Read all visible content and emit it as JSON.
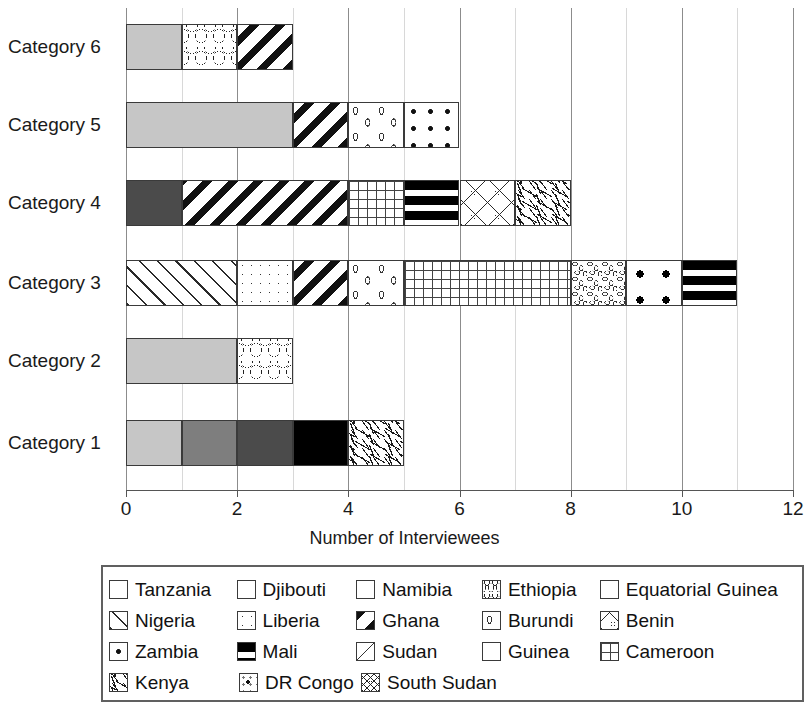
{
  "chart_data": {
    "type": "bar",
    "orientation": "horizontal",
    "stacked": true,
    "title": "",
    "xlabel": "Number of Interviewees",
    "ylabel": "",
    "xlim": [
      0,
      12
    ],
    "xticks": [
      0,
      2,
      4,
      6,
      8,
      10,
      12
    ],
    "xtick_labels": [
      "0",
      "2",
      "4",
      "6",
      "8",
      "10",
      "12"
    ],
    "minor_tick_step": 1,
    "grid": "vertical",
    "legend_position": "bottom",
    "categories": [
      "Category 1",
      "Category 2",
      "Category 3",
      "Category 4",
      "Category 5",
      "Category 6"
    ],
    "series": [
      {
        "name": "Tanzania",
        "values": [
          1,
          2,
          0,
          0,
          3,
          1
        ]
      },
      {
        "name": "Djibouti",
        "values": [
          1,
          0,
          0,
          0,
          0,
          0
        ]
      },
      {
        "name": "Namibia",
        "values": [
          1,
          0,
          0,
          1,
          0,
          0
        ]
      },
      {
        "name": "Ethiopia",
        "values": [
          0,
          1,
          0,
          0,
          0,
          1
        ]
      },
      {
        "name": "Equatorial Guinea",
        "values": [
          1,
          0,
          0,
          0,
          0,
          0
        ]
      },
      {
        "name": "Nigeria",
        "values": [
          0,
          0,
          2,
          0,
          0,
          0
        ]
      },
      {
        "name": "Liberia",
        "values": [
          0,
          0,
          1,
          0,
          0,
          0
        ]
      },
      {
        "name": "Ghana",
        "values": [
          0,
          0,
          1,
          3,
          1,
          1
        ]
      },
      {
        "name": "Burundi",
        "values": [
          0,
          0,
          1,
          0,
          1,
          0
        ]
      },
      {
        "name": "Benin",
        "values": [
          0,
          0,
          0,
          1,
          0,
          0
        ]
      },
      {
        "name": "Zambia",
        "values": [
          0,
          0,
          0,
          0,
          1,
          0
        ]
      },
      {
        "name": "Mali",
        "values": [
          0,
          0,
          1,
          1,
          0,
          0
        ]
      },
      {
        "name": "Sudan",
        "values": [
          0,
          0,
          0,
          0,
          0,
          0
        ]
      },
      {
        "name": "Guinea",
        "values": [
          0,
          0,
          1,
          0,
          0,
          0
        ]
      },
      {
        "name": "Cameroon",
        "values": [
          0,
          0,
          3,
          1,
          0,
          0
        ]
      },
      {
        "name": "Kenya",
        "values": [
          1,
          0,
          0,
          1,
          0,
          0
        ]
      },
      {
        "name": "DR Congo",
        "values": [
          0,
          0,
          0,
          0,
          0,
          0
        ]
      },
      {
        "name": "South Sudan",
        "values": [
          0,
          0,
          1,
          0,
          0,
          0
        ]
      }
    ],
    "totals": [
      5,
      3,
      11,
      8,
      6,
      3
    ],
    "bars": [
      {
        "category": "Category 6",
        "total": 3,
        "segments": [
          {
            "label": "Tanzania",
            "start": 0,
            "value": 1,
            "pattern": "p-tanzania"
          },
          {
            "label": "Ethiopia",
            "start": 1,
            "value": 1,
            "pattern": "p-ethiopia"
          },
          {
            "label": "Ghana",
            "start": 2,
            "value": 1,
            "pattern": "p-ghana"
          }
        ]
      },
      {
        "category": "Category 5",
        "total": 6,
        "segments": [
          {
            "label": "Tanzania",
            "start": 0,
            "value": 3,
            "pattern": "p-tanzania"
          },
          {
            "label": "Ghana",
            "start": 3,
            "value": 1,
            "pattern": "p-ghana"
          },
          {
            "label": "Burundi",
            "start": 4,
            "value": 1,
            "pattern": "p-burundi"
          },
          {
            "label": "Zambia",
            "start": 5,
            "value": 1,
            "pattern": "p-zambia"
          }
        ]
      },
      {
        "category": "Category 4",
        "total": 8,
        "segments": [
          {
            "label": "Namibia",
            "start": 0,
            "value": 1,
            "pattern": "p-namibia"
          },
          {
            "label": "Ghana",
            "start": 1,
            "value": 3,
            "pattern": "p-ghana"
          },
          {
            "label": "Cameroon",
            "start": 4,
            "value": 1,
            "pattern": "p-cameroon"
          },
          {
            "label": "Mali",
            "start": 5,
            "value": 1,
            "pattern": "p-mali"
          },
          {
            "label": "Benin",
            "start": 6,
            "value": 1,
            "pattern": "p-benin"
          },
          {
            "label": "Kenya",
            "start": 7,
            "value": 1,
            "pattern": "p-kenya"
          }
        ]
      },
      {
        "category": "Category 3",
        "total": 11,
        "segments": [
          {
            "label": "Nigeria",
            "start": 0,
            "value": 2,
            "pattern": "p-nigeria"
          },
          {
            "label": "Liberia",
            "start": 2,
            "value": 1,
            "pattern": "p-liberia"
          },
          {
            "label": "Ghana",
            "start": 3,
            "value": 1,
            "pattern": "p-ghana"
          },
          {
            "label": "Burundi",
            "start": 4,
            "value": 1,
            "pattern": "p-burundi"
          },
          {
            "label": "Cameroon",
            "start": 5,
            "value": 3,
            "pattern": "p-cameroon"
          },
          {
            "label": "South Sudan",
            "start": 8,
            "value": 1,
            "pattern": "p-southsudan"
          },
          {
            "label": "Guinea",
            "start": 9,
            "value": 1,
            "pattern": "p-guinea"
          },
          {
            "label": "Mali",
            "start": 10,
            "value": 1,
            "pattern": "p-mali"
          }
        ]
      },
      {
        "category": "Category 2",
        "total": 3,
        "segments": [
          {
            "label": "Tanzania",
            "start": 0,
            "value": 2,
            "pattern": "p-tanzania"
          },
          {
            "label": "Ethiopia",
            "start": 2,
            "value": 1,
            "pattern": "p-ethiopia"
          }
        ]
      },
      {
        "category": "Category 1",
        "total": 5,
        "segments": [
          {
            "label": "Tanzania",
            "start": 0,
            "value": 1,
            "pattern": "p-tanzania"
          },
          {
            "label": "Djibouti",
            "start": 1,
            "value": 1,
            "pattern": "p-djibouti"
          },
          {
            "label": "Namibia",
            "start": 2,
            "value": 1,
            "pattern": "p-namibia"
          },
          {
            "label": "Equatorial Guinea",
            "start": 3,
            "value": 1,
            "pattern": "p-eqguinea"
          },
          {
            "label": "Kenya",
            "start": 4,
            "value": 1,
            "pattern": "p-kenya"
          }
        ]
      }
    ],
    "legend": [
      [
        {
          "label": "Tanzania",
          "pattern": "p-tanzania",
          "width": 130
        },
        {
          "label": "Djibouti",
          "pattern": "p-djibouti",
          "width": 122
        },
        {
          "label": "Namibia",
          "pattern": "p-namibia",
          "width": 128
        },
        {
          "label": "Ethiopia",
          "pattern": "p-ethiopia-legend",
          "width": 120
        },
        {
          "label": "Equatorial Guinea",
          "pattern": "p-eqguinea",
          "width": 200
        }
      ],
      [
        {
          "label": "Nigeria",
          "pattern": "p-nigeria",
          "width": 130
        },
        {
          "label": "Liberia",
          "pattern": "p-liberia",
          "width": 122
        },
        {
          "label": "Ghana",
          "pattern": "p-ghana",
          "width": 128
        },
        {
          "label": "Burundi",
          "pattern": "p-burundi",
          "width": 120
        },
        {
          "label": "Benin",
          "pattern": "p-benin",
          "width": 200
        }
      ],
      [
        {
          "label": "Zambia",
          "pattern": "p-zambia",
          "width": 130
        },
        {
          "label": "Mali",
          "pattern": "p-mali",
          "width": 122
        },
        {
          "label": "Sudan",
          "pattern": "p-sudan",
          "width": 128
        },
        {
          "label": "Guinea",
          "pattern": "p-guinea-legend",
          "width": 120
        },
        {
          "label": "Cameroon",
          "pattern": "p-cameroon",
          "width": 200
        }
      ],
      [
        {
          "label": "Kenya",
          "pattern": "p-kenya",
          "width": 130
        },
        {
          "label": "DR Congo",
          "pattern": "p-drcongo",
          "width": 122
        },
        {
          "label": "South Sudan",
          "pattern": "p-southsudan-legend",
          "width": 200
        }
      ]
    ],
    "colors": {
      "tanzania": "#c6c6c6",
      "djibouti": "#7e7e7e",
      "namibia": "#4b4b4b",
      "equatorial_guinea": "#000000",
      "axis": "#555555",
      "gridline_major": "#8c8c8c",
      "gridline_minor": "#d8d8d8",
      "text": "#1a1a1a",
      "background": "#ffffff"
    }
  }
}
